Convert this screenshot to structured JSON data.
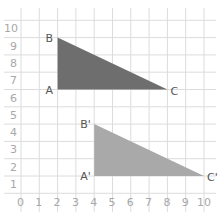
{
  "diagram": {
    "type": "coordinate-grid-translation",
    "grid": {
      "x_min": 0,
      "x_max": 10,
      "y_min": 0,
      "y_max": 10
    },
    "x_tick_labels": [
      "0",
      "1",
      "2",
      "3",
      "4",
      "5",
      "6",
      "7",
      "8",
      "9",
      "10"
    ],
    "y_tick_labels": [
      "0",
      "1",
      "2",
      "3",
      "4",
      "5",
      "6",
      "7",
      "8",
      "9",
      "10"
    ],
    "shapes": [
      {
        "name": "triangle-abc",
        "fill": "#6e6e6e",
        "vertices": [
          {
            "label": "A",
            "x": 2,
            "y": 6
          },
          {
            "label": "B",
            "x": 2,
            "y": 9
          },
          {
            "label": "C",
            "x": 8,
            "y": 6
          }
        ]
      },
      {
        "name": "triangle-abc-prime",
        "fill": "#a9a9a9",
        "vertices": [
          {
            "label": "A'",
            "x": 4,
            "y": 1
          },
          {
            "label": "B'",
            "x": 4,
            "y": 4
          },
          {
            "label": "C'",
            "x": 10,
            "y": 1
          }
        ]
      }
    ]
  }
}
